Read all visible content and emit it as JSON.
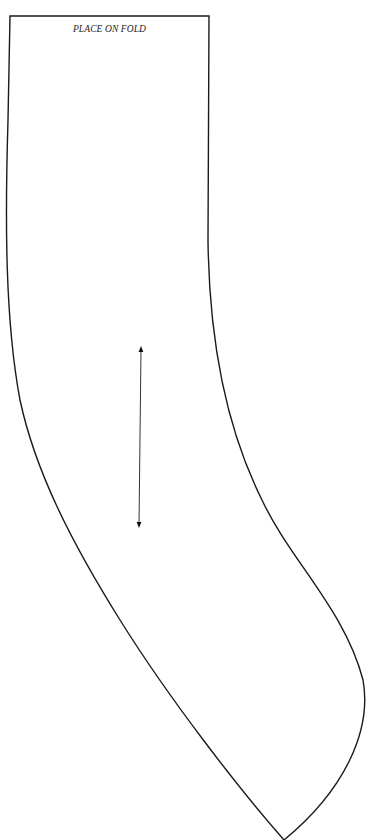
{
  "pattern_piece": {
    "fold_label": "PLACE ON FOLD",
    "stroke_color": "#1a1a1a",
    "background": "#ffffff",
    "outline": {
      "top_left": [
        10,
        16
      ],
      "top_right": [
        209,
        16
      ],
      "bottom_point": [
        284,
        840
      ],
      "right_max_bulge": [
        365,
        700
      ]
    },
    "grainline": {
      "type": "double-headed-arrow",
      "start": [
        141,
        347
      ],
      "end": [
        139,
        527
      ]
    }
  }
}
